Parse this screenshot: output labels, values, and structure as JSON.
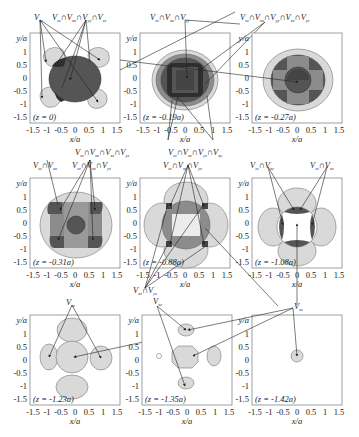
{
  "figure": {
    "type": "multi-panel contour figure",
    "x_axis_label": "x/a",
    "y_axis_label": "y/a",
    "x_ticks": [
      "-1.5",
      "-1",
      "-0.5",
      "0",
      "0.5",
      "1",
      "1.5"
    ],
    "y_ticks": [
      "1",
      "0.5",
      "0",
      "-0.5",
      "-1",
      "-1.5"
    ],
    "colors": {
      "light": "#d9d9d9",
      "medium": "#8c8c8c",
      "dark": "#555555",
      "darkest": "#2e2e2e",
      "frame": "#888888",
      "outline": "#777777"
    },
    "panels": [
      {
        "id": "p1",
        "z_label": "(z = 0)"
      },
      {
        "id": "p2",
        "z_label": "(z = -0.19a)"
      },
      {
        "id": "p3",
        "z_label": "(z = -0.27a)"
      },
      {
        "id": "p4",
        "z_label": "(z = -0.31a)"
      },
      {
        "id": "p5",
        "z_label": "(z = -0.88a)"
      },
      {
        "id": "p6",
        "z_label": "(z = -1.08a)"
      },
      {
        "id": "p7",
        "z_label": "(z = -1.23a)"
      },
      {
        "id": "p8",
        "z_label": "(z = -1.35a)"
      },
      {
        "id": "p9",
        "z_label": "(z = -1.42a)"
      }
    ],
    "annotations": {
      "a1": {
        "base": [
          "V",
          "∩V",
          "∩V",
          "∩V"
        ],
        "subs": [
          "zz",
          "xx",
          "yy",
          "zz"
        ],
        "text": "V_zz ∩ V_xx ∩ V_yy ∩ V_zz"
      },
      "a0": {
        "base": [
          "V"
        ],
        "subs": [
          "zz"
        ],
        "text": "V_zz"
      },
      "a2": {
        "base": [
          "V",
          "∩V",
          "∩V"
        ],
        "subs": [
          "zz",
          "xx",
          "yy"
        ],
        "text": "V_zz ∩ V_xx ∩ V_yy"
      },
      "a3": {
        "base": [
          "V",
          "∩V",
          "∩V",
          "∩V",
          "∩V"
        ],
        "subs": [
          "zz",
          "xx",
          "yy",
          "xz",
          "yz"
        ],
        "text": "V_zz ∩ V_xx ∩ V_yy ∩ V_xz ∩ V_yz"
      },
      "a4": {
        "base": [
          "V",
          "∩V",
          "∩V",
          "∩V"
        ],
        "subs": [
          "zz",
          "xx",
          "xz",
          "yz"
        ],
        "text": "V_zz ∩ V_xx ∩ V_xz ∩ V_yz"
      },
      "a5": {
        "base": [
          "V",
          "∩V",
          "∩V",
          "∩V"
        ],
        "subs": [
          "zz",
          "xz",
          "yz",
          "xy"
        ],
        "text": "V_zz ∩ V_xz ∩ V_yz ∩ V_xy"
      },
      "a6": {
        "base": [
          "V",
          "∩V"
        ],
        "subs": [
          "zz",
          "xx"
        ],
        "text": "V_zz ∩ V_xx"
      },
      "a7": {
        "base": [
          "V",
          "∩V",
          "∩V"
        ],
        "subs": [
          "zz",
          "xz",
          "yz"
        ],
        "text": "V_zz ∩ V_xz ∩ V_yz"
      },
      "a8": {
        "base": [
          "V",
          "∩V",
          "∩V"
        ],
        "subs": [
          "zz",
          "xz",
          "yz"
        ],
        "text": "V_zz ∩ V_xz ∩ V_yz"
      },
      "a9": {
        "base": [
          "V",
          "∩V"
        ],
        "subs": [
          "zz",
          "xz"
        ],
        "text": "V_zz ∩ V_xz"
      },
      "a10": {
        "base": [
          "V",
          "∩V"
        ],
        "subs": [
          "zz",
          "xz"
        ],
        "text": "V_zz ∩ V_xz"
      },
      "a11": {
        "base": [
          "V",
          "∩V"
        ],
        "subs": [
          "xz",
          "yz"
        ],
        "text": "V_xz ∩ V_yz"
      },
      "a12": {
        "base": [
          "V"
        ],
        "subs": [
          "xz"
        ],
        "text": "V_xz"
      },
      "a13": {
        "base": [
          "V"
        ],
        "subs": [
          "xz"
        ],
        "text": "V_xz"
      },
      "a14": {
        "base": [
          "V"
        ],
        "subs": [
          "zz"
        ],
        "text": "V_zz"
      }
    }
  }
}
